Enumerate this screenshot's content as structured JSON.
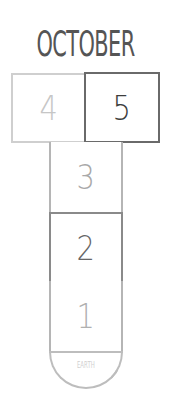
{
  "title": "OCTOBER",
  "squares": [
    {
      "id": "4",
      "label": "4",
      "state": "light"
    },
    {
      "id": "5",
      "label": "5",
      "state": "dark"
    },
    {
      "id": "3",
      "label": "3",
      "state": "light"
    },
    {
      "id": "2",
      "label": "2",
      "state": "dark"
    },
    {
      "id": "1",
      "label": "1",
      "state": "light"
    }
  ],
  "base": {
    "label": "EARTH"
  },
  "colors": {
    "light_border": "#cfcfcf",
    "dark_border": "#6a6a6a",
    "text_dark": "#3d3d3d",
    "text_light": "#c6c6c6"
  }
}
